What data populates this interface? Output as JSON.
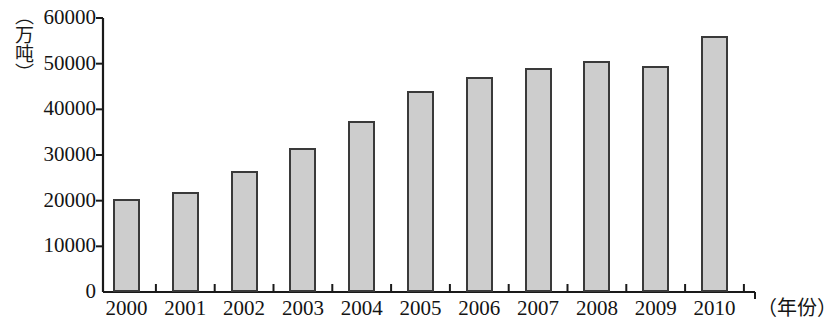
{
  "chart_data": {
    "type": "bar",
    "title": "",
    "subtitle": "",
    "xlabel": "（年份）",
    "ylabel": "（万吨）",
    "categories": [
      "2000",
      "2001",
      "2002",
      "2003",
      "2004",
      "2005",
      "2006",
      "2007",
      "2008",
      "2009",
      "2010"
    ],
    "values": [
      20300,
      22000,
      26500,
      31500,
      37500,
      44000,
      47000,
      49000,
      50500,
      49500,
      56000
    ],
    "series": [
      {
        "name": "",
        "values": [
          20300,
          22000,
          26500,
          31500,
          37500,
          44000,
          47000,
          49000,
          50500,
          49500,
          56000
        ]
      }
    ],
    "ylim": [
      0,
      60000
    ],
    "yticks": [
      0,
      10000,
      20000,
      30000,
      40000,
      50000,
      60000
    ],
    "ytick_labels": [
      "0",
      "10000",
      "20000",
      "30000",
      "40000",
      "50000",
      "60000"
    ],
    "xtick_labels": [
      "2000",
      "2001",
      "2002",
      "2003",
      "2004",
      "2005",
      "2006",
      "2007",
      "2008",
      "2009",
      "2010"
    ],
    "grid": false,
    "legend": false,
    "legend_position": "none",
    "bar_fill_color": "#cdcdcd",
    "bar_border_color": "#3a3a3a",
    "axis_color": "#1a1a1a",
    "annotations": []
  },
  "axes": {
    "y_unit_text": "（万吨）",
    "x_unit_text": "（年份）"
  }
}
